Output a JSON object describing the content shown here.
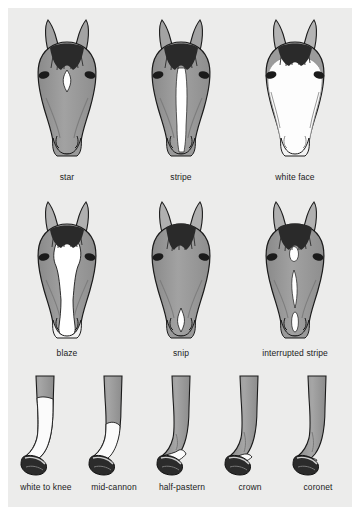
{
  "figure": {
    "background_color": "#ffffff",
    "plate_color": "#ececeb",
    "coat_color": "#9c9c9c",
    "coat_shadow_color": "#868686",
    "marking_color": "#ffffff",
    "outline_color": "#1b1b1b",
    "mane_color": "#2a2a2a",
    "hoof_color": "#262626"
  },
  "rows": [
    {
      "name": "face-markings-row-1",
      "cells": [
        {
          "name": "star",
          "label": "star",
          "marking": "small diamond on forehead"
        },
        {
          "name": "stripe",
          "label": "stripe",
          "marking": "narrow vertical band down nasal bone"
        },
        {
          "name": "white-face",
          "label": "white face",
          "marking": "white covering most of the face"
        }
      ]
    },
    {
      "name": "face-markings-row-2",
      "cells": [
        {
          "name": "blaze",
          "label": "blaze",
          "marking": "broad white band from forehead to muzzle"
        },
        {
          "name": "snip",
          "label": "snip",
          "marking": "small white patch on the muzzle"
        },
        {
          "name": "interrupted-stripe",
          "label": "interrupted stripe",
          "marking": "broken vertical segments"
        }
      ]
    },
    {
      "name": "leg-markings-row",
      "cells": [
        {
          "name": "white-to-knee",
          "label": "white to knee",
          "marking": "white up to the knee"
        },
        {
          "name": "mid-cannon",
          "label": "mid-cannon",
          "marking": "white to mid cannon bone"
        },
        {
          "name": "half-pastern",
          "label": "half-pastern",
          "marking": "white over half the pastern"
        },
        {
          "name": "crown",
          "label": "crown",
          "marking": "white just above the hoof"
        },
        {
          "name": "coronet",
          "label": "coronet",
          "marking": "thin white band at coronet"
        }
      ]
    }
  ]
}
